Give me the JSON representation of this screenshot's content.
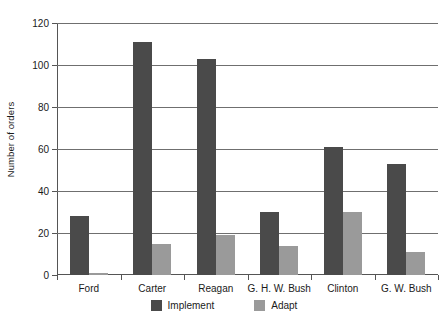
{
  "chart_data": {
    "type": "bar",
    "title": "",
    "xlabel": "",
    "ylabel": "Number of orders",
    "ylim": [
      0,
      120
    ],
    "ytick_step": 20,
    "yticks": [
      0,
      20,
      40,
      60,
      80,
      100,
      120
    ],
    "grid": true,
    "legend_position": "bottom",
    "categories": [
      "Ford",
      "Carter",
      "Reagan",
      "G. H. W. Bush",
      "Clinton",
      "G. W. Bush"
    ],
    "series": [
      {
        "name": "Implement",
        "color": "#4a4a4a",
        "values": [
          28,
          111,
          103,
          30,
          61,
          53
        ]
      },
      {
        "name": "Adapt",
        "color": "#9a9a9a",
        "values": [
          1,
          15,
          19,
          14,
          30,
          11
        ]
      }
    ]
  },
  "colors": {
    "implement": "#4a4a4a",
    "adapt": "#9a9a9a",
    "gridline": "#6f6f6f",
    "axis": "#555555",
    "background": "#ffffff"
  }
}
